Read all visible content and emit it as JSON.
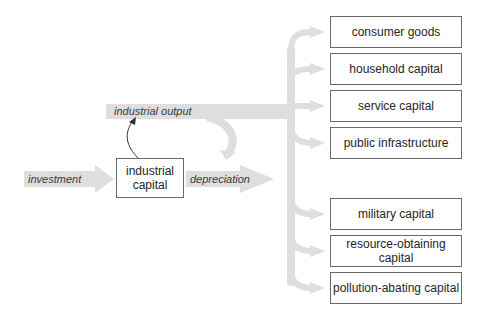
{
  "diagram": {
    "stock": {
      "label_line1": "industrial",
      "label_line2": "capital"
    },
    "flows": {
      "investment": "investment",
      "depreciation": "depreciation",
      "industrial_output": "industrial output"
    },
    "sectors": [
      "consumer goods",
      "household capital",
      "service capital",
      "public infrastructure",
      "military capital",
      "resource-obtaining capital",
      "pollution-abating capital"
    ],
    "colors": {
      "flow": "#dedede",
      "box_border": "#6a6a6a",
      "text": "#262626"
    }
  }
}
